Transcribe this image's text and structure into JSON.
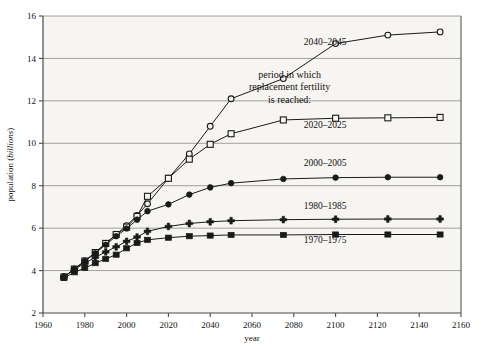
{
  "chart_data": {
    "type": "line",
    "title": "",
    "xlabel": "year",
    "ylabel": "population (billions)",
    "ylabel_plain": "population (",
    "ylabel_italic": "billions",
    "ylabel_tail": ")",
    "xlim": [
      1960,
      2160
    ],
    "ylim": [
      2,
      16
    ],
    "xticks": [
      1960,
      1980,
      2000,
      2020,
      2040,
      2060,
      2080,
      2100,
      2120,
      2140,
      2160
    ],
    "yticks": [
      2,
      4,
      6,
      8,
      10,
      12,
      14,
      16
    ],
    "xtick_labels": [
      "1960",
      "1980",
      "2000",
      "2020",
      "2040",
      "2060",
      "2080",
      "2100",
      "2120",
      "2140",
      "2160"
    ],
    "ytick_labels": [
      "2",
      "4",
      "6",
      "8",
      "10",
      "12",
      "14",
      "16"
    ],
    "grid": true,
    "grid_axis": "y",
    "legend_position": "inline-right",
    "annotation": {
      "lines": [
        "period in which",
        "replacement fertility",
        "is reached:"
      ],
      "x": 2078,
      "y": 13.1
    },
    "series": [
      {
        "name": "2040-2045",
        "label": "2040–2045",
        "marker": "open-circle",
        "label_x": 2095,
        "label_y": 14.62,
        "x": [
          1970,
          1975,
          1980,
          1985,
          1990,
          1995,
          2000,
          2005,
          2010,
          2020,
          2030,
          2040,
          2050,
          2075,
          2100,
          2125,
          2150
        ],
        "y": [
          3.7,
          4.07,
          4.45,
          4.85,
          5.28,
          5.7,
          6.12,
          6.6,
          7.15,
          8.35,
          9.5,
          10.8,
          12.1,
          13.05,
          14.7,
          15.1,
          15.25
        ]
      },
      {
        "name": "2020-2025",
        "label": "2020–2025",
        "marker": "open-square",
        "label_x": 2095,
        "label_y": 10.72,
        "x": [
          1970,
          1975,
          1980,
          1985,
          1990,
          1995,
          2000,
          2005,
          2010,
          2020,
          2030,
          2040,
          2050,
          2075,
          2100,
          2125,
          2150
        ],
        "y": [
          3.7,
          4.07,
          4.45,
          4.85,
          5.28,
          5.7,
          6.05,
          6.55,
          7.5,
          8.35,
          9.25,
          9.95,
          10.45,
          11.1,
          11.18,
          11.2,
          11.22
        ]
      },
      {
        "name": "2000-2005",
        "label": "2000–2005",
        "marker": "filled-circle",
        "label_x": 2095,
        "label_y": 8.95,
        "x": [
          1970,
          1975,
          1980,
          1985,
          1990,
          1995,
          2000,
          2005,
          2010,
          2020,
          2030,
          2040,
          2050,
          2075,
          2100,
          2125,
          2150
        ],
        "y": [
          3.7,
          4.07,
          4.45,
          4.82,
          5.22,
          5.62,
          5.98,
          6.4,
          6.8,
          7.12,
          7.58,
          7.92,
          8.12,
          8.32,
          8.38,
          8.4,
          8.4
        ]
      },
      {
        "name": "1980-1985",
        "label": "1980–1985",
        "marker": "plus",
        "label_x": 2095,
        "label_y": 6.92,
        "x": [
          1970,
          1975,
          1980,
          1985,
          1990,
          1995,
          2000,
          2005,
          2010,
          2020,
          2030,
          2040,
          2050,
          2075,
          2100,
          2125,
          2150
        ],
        "y": [
          3.7,
          4.05,
          4.35,
          4.62,
          4.88,
          5.12,
          5.38,
          5.58,
          5.85,
          6.08,
          6.22,
          6.3,
          6.35,
          6.4,
          6.42,
          6.43,
          6.43
        ]
      },
      {
        "name": "1970-1975",
        "label": "1970–1975",
        "marker": "filled-square",
        "label_x": 2095,
        "label_y": 5.28,
        "x": [
          1970,
          1975,
          1980,
          1985,
          1990,
          1995,
          2000,
          2005,
          2010,
          2020,
          2030,
          2040,
          2050,
          2075,
          2100,
          2125,
          2150
        ],
        "y": [
          3.65,
          3.92,
          4.12,
          4.35,
          4.55,
          4.75,
          5.05,
          5.3,
          5.45,
          5.55,
          5.62,
          5.65,
          5.68,
          5.68,
          5.7,
          5.7,
          5.7
        ]
      }
    ],
    "colors": {
      "background": "#f6f5f1",
      "page_background": "#ffffff",
      "frame": "#4a4a4a",
      "gridline": "#8a8a8a",
      "line": "#1a1a1a",
      "text": "#111111"
    }
  }
}
